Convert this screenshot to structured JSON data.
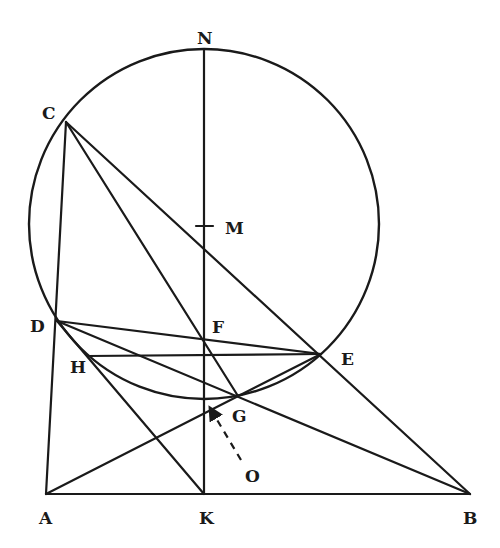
{
  "figure": {
    "type": "geometry-diagram",
    "circle": {
      "center": [
        204,
        224
      ],
      "radius": 175
    },
    "points": {
      "N": [
        204,
        50
      ],
      "C": [
        66,
        122
      ],
      "M": [
        204,
        226
      ],
      "D": [
        57,
        321
      ],
      "F": [
        204,
        339
      ],
      "H": [
        88,
        356
      ],
      "E": [
        321,
        354
      ],
      "G": [
        238,
        396
      ],
      "A": [
        46,
        494
      ],
      "K": [
        204,
        494
      ],
      "B": [
        470,
        494
      ],
      "O": [
        241,
        460
      ]
    },
    "labels": {
      "N": "N",
      "C": "C",
      "M": "M",
      "D": "D",
      "F": "F",
      "H": "H",
      "E": "E",
      "G": "G",
      "A": "A",
      "K": "K",
      "B": "B",
      "O": "O"
    },
    "segments": [
      [
        "N",
        "K"
      ],
      [
        "A",
        "B"
      ],
      [
        "C",
        "A"
      ],
      [
        "C",
        "B"
      ],
      [
        "C",
        "G"
      ],
      [
        "D",
        "E"
      ],
      [
        "H",
        "E"
      ],
      [
        "D",
        "B"
      ],
      [
        "D",
        "K"
      ],
      [
        "A",
        "E"
      ]
    ],
    "arrow": {
      "from": "O",
      "to_point": [
        209,
        406
      ],
      "style": "dashed"
    }
  }
}
